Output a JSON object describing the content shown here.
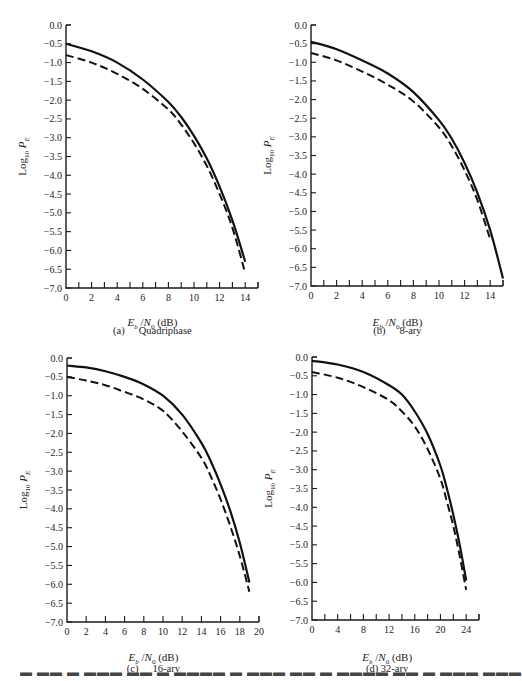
{
  "chart_data": [
    {
      "id": "a",
      "type": "line",
      "title": "(a)    Quadriphase",
      "xlabel": "E_b / N_0 (dB)",
      "ylabel": "Log10 P_E",
      "xlim": [
        0,
        15
      ],
      "ylim": [
        -7.0,
        0.0
      ],
      "xticks_labeled": [
        0,
        2,
        4,
        6,
        8,
        10,
        12,
        14
      ],
      "xtick_step": 1,
      "yticks": [
        "0.0",
        "-0.5",
        "-1.0",
        "-1.5",
        "-2.0",
        "-2.5",
        "-3.0",
        "-3.5",
        "-4.0",
        "-4.5",
        "-5.0",
        "-5.5",
        "-6.0",
        "-6.5",
        "-7.0"
      ],
      "grid": false,
      "legend": null,
      "series": [
        {
          "name": "solid",
          "style": "solid",
          "x": [
            0,
            2,
            4,
            6,
            8,
            9,
            10,
            11,
            12,
            13,
            14
          ],
          "y": [
            -0.5,
            -0.7,
            -1.0,
            -1.45,
            -2.05,
            -2.45,
            -2.95,
            -3.55,
            -4.3,
            -5.2,
            -6.3
          ]
        },
        {
          "name": "dashed",
          "style": "dashed",
          "x": [
            0,
            2,
            4,
            6,
            8,
            9,
            10,
            11,
            12,
            13,
            14
          ],
          "y": [
            -0.8,
            -1.0,
            -1.3,
            -1.7,
            -2.25,
            -2.65,
            -3.15,
            -3.75,
            -4.5,
            -5.4,
            -6.6
          ]
        }
      ]
    },
    {
      "id": "b",
      "type": "line",
      "title": "(b)    8-ary",
      "xlabel": "E_b / N_0 (dB)",
      "ylabel": "Log10 P_E",
      "xlim": [
        0,
        15
      ],
      "ylim": [
        -7.0,
        0.0
      ],
      "xticks_labeled": [
        0,
        2,
        4,
        6,
        8,
        10,
        12,
        14
      ],
      "xtick_step": 1,
      "yticks": [
        "0.0",
        "-0.5",
        "-1.0",
        "-1.5",
        "-2.0",
        "-2.5",
        "-3.0",
        "-3.5",
        "-4.0",
        "-4.5",
        "-5.0",
        "-5.5",
        "-6.0",
        "-6.5",
        "-7.0"
      ],
      "grid": false,
      "legend": null,
      "series": [
        {
          "name": "solid",
          "style": "solid",
          "x": [
            0,
            2,
            4,
            6,
            8,
            10,
            11,
            12,
            13,
            14,
            15
          ],
          "y": [
            -0.45,
            -0.65,
            -0.95,
            -1.3,
            -1.8,
            -2.55,
            -3.05,
            -3.7,
            -4.5,
            -5.5,
            -6.8
          ]
        },
        {
          "name": "dashed",
          "style": "dashed",
          "x": [
            0,
            2,
            4,
            6,
            8,
            10,
            11,
            12,
            13,
            14
          ],
          "y": [
            -0.75,
            -0.95,
            -1.25,
            -1.6,
            -2.05,
            -2.75,
            -3.25,
            -3.9,
            -4.7,
            -5.75
          ]
        }
      ]
    },
    {
      "id": "c",
      "type": "line",
      "title": "(c)    16-ary",
      "xlabel": "E_b / N_0 (dB)",
      "ylabel": "Log10 P_E",
      "xlim": [
        0,
        20
      ],
      "ylim": [
        -7.0,
        0.0
      ],
      "xticks_labeled": [
        0,
        2,
        4,
        6,
        8,
        10,
        12,
        14,
        16,
        18,
        20
      ],
      "xtick_step": 2,
      "yticks": [
        "0.0",
        "-0.5",
        "-1.0",
        "-1.5",
        "-2.0",
        "-2.5",
        "-3.0",
        "-3.5",
        "-4.0",
        "-4.5",
        "-5.0",
        "-5.5",
        "-6.0",
        "-6.5",
        "-7.0"
      ],
      "grid": false,
      "legend": null,
      "series": [
        {
          "name": "solid",
          "style": "solid",
          "x": [
            0,
            2,
            4,
            6,
            8,
            10,
            12,
            14,
            15,
            16,
            17,
            18,
            19
          ],
          "y": [
            -0.2,
            -0.25,
            -0.35,
            -0.5,
            -0.7,
            -1.0,
            -1.5,
            -2.25,
            -2.75,
            -3.35,
            -4.05,
            -4.9,
            -5.95
          ]
        },
        {
          "name": "dashed",
          "style": "dashed",
          "x": [
            0,
            2,
            4,
            6,
            8,
            10,
            12,
            14,
            15,
            16,
            17,
            18,
            19
          ],
          "y": [
            -0.5,
            -0.6,
            -0.72,
            -0.9,
            -1.1,
            -1.4,
            -1.95,
            -2.65,
            -3.15,
            -3.75,
            -4.45,
            -5.25,
            -6.2
          ]
        }
      ]
    },
    {
      "id": "d",
      "type": "line",
      "title": "(d) 32-ary",
      "xlabel": "E_b / N_0 (dB)",
      "ylabel": "Log10 P_E",
      "xlim": [
        0,
        26
      ],
      "ylim": [
        -7.0,
        0.0
      ],
      "xticks_labeled": [
        0,
        4,
        8,
        12,
        16,
        20,
        24
      ],
      "xtick_step": 2,
      "yticks": [
        "0.0",
        "-0.5",
        "-1.0",
        "-1.5",
        "-2.0",
        "-2.5",
        "-3.0",
        "-3.5",
        "-4.0",
        "-4.5",
        "-5.0",
        "-5.5",
        "-6.0",
        "-6.5",
        "-7.0"
      ],
      "grid": false,
      "legend": null,
      "series": [
        {
          "name": "solid",
          "style": "solid",
          "x": [
            0,
            4,
            8,
            12,
            14,
            16,
            18,
            20,
            21,
            22,
            23,
            24
          ],
          "y": [
            -0.1,
            -0.2,
            -0.4,
            -0.75,
            -1.0,
            -1.45,
            -2.05,
            -2.9,
            -3.5,
            -4.2,
            -5.0,
            -5.95
          ]
        },
        {
          "name": "dashed",
          "style": "dashed",
          "x": [
            0,
            4,
            8,
            12,
            14,
            16,
            18,
            20,
            21,
            22,
            23,
            24
          ],
          "y": [
            -0.4,
            -0.55,
            -0.8,
            -1.15,
            -1.45,
            -1.85,
            -2.45,
            -3.25,
            -3.85,
            -4.5,
            -5.3,
            -6.2
          ]
        }
      ]
    }
  ],
  "captions": {
    "a": {
      "letter": "(a)",
      "name": "Quadriphase"
    },
    "b": {
      "letter": "(b)",
      "name": "8-ary"
    },
    "c": {
      "letter": "(c)",
      "name": "16-ary"
    },
    "d": {
      "letter": "(d)",
      "name": "32-ary"
    }
  },
  "axis_labels": {
    "x": "E_b / N_0 (dB)",
    "y": "Log10 P_E"
  },
  "cutoff_text": "Figure caption (truncated at page edge)"
}
